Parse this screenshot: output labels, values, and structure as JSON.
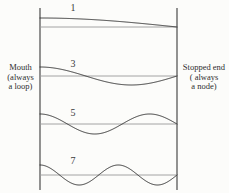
{
  "figure": {
    "background_color": "#fcfcfa",
    "wall_color": "#3a3a3a",
    "axis_color": "#9a9a9a",
    "wave_color": "#2d2d2d"
  },
  "labels": {
    "left_end": {
      "line1": "Mouth",
      "line2": "(always",
      "line3": "a loop)"
    },
    "right_end": {
      "line1": "Stopped end",
      "line2": "( always",
      "line3": "a node)"
    }
  },
  "harmonics": [
    {
      "number": "1",
      "quarter_wavelengths": 1,
      "axis_y": 27,
      "amplitude": 9,
      "label_x": 66,
      "label_y": 3
    },
    {
      "number": "3",
      "quarter_wavelengths": 3,
      "axis_y": 76,
      "amplitude": 9,
      "label_x": 66,
      "label_y": 59
    },
    {
      "number": "5",
      "quarter_wavelengths": 5,
      "axis_y": 124,
      "amplitude": 10,
      "label_x": 66,
      "label_y": 108
    },
    {
      "number": "7",
      "quarter_wavelengths": 7,
      "axis_y": 175,
      "amplitude": 10,
      "label_x": 66,
      "label_y": 156
    }
  ],
  "pipe": {
    "left_wall_x": 40,
    "right_wall_x": 177,
    "top_y": 8,
    "bottom_y": 190
  },
  "chart_data": {
    "type": "line",
    "xlabel": "",
    "ylabel": "",
    "x": [
      0,
      0.25,
      0.5,
      0.75,
      1
    ],
    "xlim": [
      0,
      1
    ],
    "grid": false,
    "legend": "none",
    "annotations": [
      "Mouth (always a loop)",
      "Stopped end ( always a node)"
    ],
    "series": [
      {
        "name": "1",
        "harmonic": 1,
        "quarter_wavelengths": 1,
        "formula": "cos(1*pi*x/2)",
        "values": [
          1,
          0.924,
          0.707,
          0.383,
          0
        ]
      },
      {
        "name": "3",
        "harmonic": 3,
        "quarter_wavelengths": 3,
        "formula": "cos(3*pi*x/2)",
        "values": [
          1,
          0.383,
          -0.707,
          -0.924,
          0
        ]
      },
      {
        "name": "5",
        "harmonic": 5,
        "quarter_wavelengths": 5,
        "formula": "cos(5*pi*x/2)",
        "values": [
          1,
          -0.383,
          -0.707,
          0.924,
          0
        ]
      },
      {
        "name": "7",
        "harmonic": 7,
        "quarter_wavelengths": 7,
        "formula": "cos(7*pi*x/2)",
        "values": [
          1,
          -0.924,
          0.707,
          -0.383,
          0
        ]
      }
    ]
  }
}
